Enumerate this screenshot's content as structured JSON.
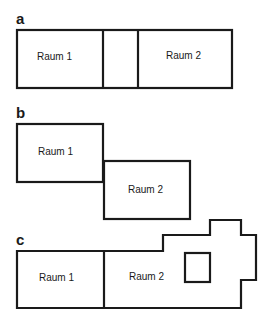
{
  "panels": [
    {
      "id": "a",
      "letter": "a",
      "rooms": [
        {
          "label": "Raum 1"
        },
        {
          "label": "Raum 2"
        }
      ],
      "description": "Two rooms joined by a small connecting room in a single row"
    },
    {
      "id": "b",
      "letter": "b",
      "rooms": [
        {
          "label": "Raum 1"
        },
        {
          "label": "Raum 2"
        }
      ],
      "description": "Two rooms touching diagonally at a corner-offset edge"
    },
    {
      "id": "c",
      "letter": "c",
      "rooms": [
        {
          "label": "Raum 1"
        },
        {
          "label": "Raum 2"
        }
      ],
      "description": "Raum 1 rectangle adjacent to irregular Raum 2 containing an inner square"
    }
  ],
  "colors": {
    "stroke": "#1a1a1a",
    "background": "#ffffff"
  }
}
